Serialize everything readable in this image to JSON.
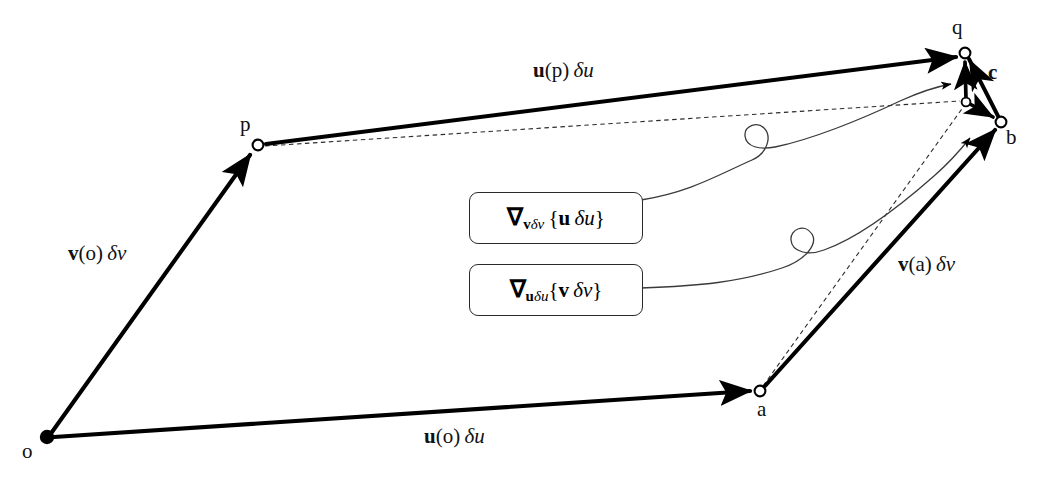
{
  "figure": {
    "type": "geometry-diagram",
    "background_color": "#ffffff",
    "line_color": "#000000"
  },
  "points": [
    {
      "id": "o",
      "label": "o",
      "x": 47,
      "y": 437,
      "marker": "filled",
      "label_x": 22,
      "label_y": 441
    },
    {
      "id": "p",
      "label": "p",
      "x": 258,
      "y": 145,
      "marker": "open",
      "label_x": 240,
      "label_y": 114
    },
    {
      "id": "a",
      "label": "a",
      "x": 760,
      "y": 391,
      "marker": "open",
      "label_x": 757,
      "label_y": 399
    },
    {
      "id": "q",
      "label": "q",
      "x": 965,
      "y": 53,
      "marker": "open",
      "label_x": 952,
      "label_y": 17
    },
    {
      "id": "b",
      "label": "b",
      "x": 1001,
      "y": 122,
      "marker": "open",
      "label_x": 1006,
      "label_y": 127
    },
    {
      "id": "j",
      "label": "",
      "x": 966,
      "y": 102,
      "marker": "open-small",
      "label_x": 0,
      "label_y": 0
    }
  ],
  "vectors": [
    {
      "id": "o-p",
      "from": "o",
      "to": "p",
      "style": "thick-arrow",
      "label_html": "<span class=\"bold\">v</span>(o)&thinsp;<span class=\"it\">&delta;v</span>",
      "label_text": "v(o) δv",
      "label_x": 68,
      "label_y": 243
    },
    {
      "id": "o-a",
      "from": "o",
      "to": "a",
      "style": "thick-arrow",
      "label_html": "<span class=\"bold\">u</span>(o)&thinsp;<span class=\"it\">&delta;u</span>",
      "label_text": "u(o) δu",
      "label_x": 424,
      "label_y": 426
    },
    {
      "id": "p-q",
      "from": "p",
      "to": "q",
      "style": "thick-arrow",
      "label_html": "<span class=\"bold\">u</span>(p)&thinsp;<span class=\"it\">&delta;u</span>",
      "label_text": "u(p) δu",
      "label_x": 533,
      "label_y": 60
    },
    {
      "id": "a-b",
      "from": "a",
      "to": "b",
      "style": "thick-arrow",
      "label_html": "<span class=\"bold\">v</span>(a)&thinsp;<span class=\"it\">&delta;v</span>",
      "label_text": "v(a) δv",
      "label_x": 898,
      "label_y": 254
    },
    {
      "id": "j-q",
      "from": "j",
      "to": "q",
      "style": "short-arrow",
      "label_html": "",
      "label_text": "",
      "label_x": 0,
      "label_y": 0
    },
    {
      "id": "j-b",
      "from": "j",
      "to": "b",
      "style": "short-arrow",
      "label_html": "",
      "label_text": "",
      "label_x": 0,
      "label_y": 0
    },
    {
      "id": "b-q",
      "from": "b",
      "to": "q",
      "style": "short-arrow",
      "label_html": "<span class=\"bold\">c</span>",
      "label_text": "c",
      "label_x": 988,
      "label_y": 62
    }
  ],
  "dashed_lines": [
    {
      "id": "p-j",
      "from": "p",
      "to": "j"
    },
    {
      "id": "a-j",
      "from": "a",
      "to": "j"
    },
    {
      "id": "j-b-dash",
      "from": "j",
      "to": "b"
    }
  ],
  "annotation_boxes": [
    {
      "id": "box-grad-v-u",
      "x": 469,
      "y": 192,
      "w": 172,
      "h": 50,
      "content_html": "<span class=\"nab\">&nabla;</span><span class=\"sub\">v</span><span class=\"subi\">&delta;v</span>&thinsp;{<span class=\"bold\">u</span>&thinsp;<span class=\"it\">&delta;u</span>}",
      "content_text": "∇_{vδv} {u δu}",
      "points_to": "q"
    },
    {
      "id": "box-grad-u-v",
      "x": 469,
      "y": 264,
      "w": 172,
      "h": 50,
      "content_html": "<span class=\"nab\">&nabla;</span><span class=\"sub\">u</span><span class=\"subi\">&delta;u</span>{<span class=\"bold\">v</span>&thinsp;<span class=\"it\">&delta;v</span>}",
      "content_text": "∇_{uδu}{v δv}",
      "points_to": "b"
    }
  ]
}
